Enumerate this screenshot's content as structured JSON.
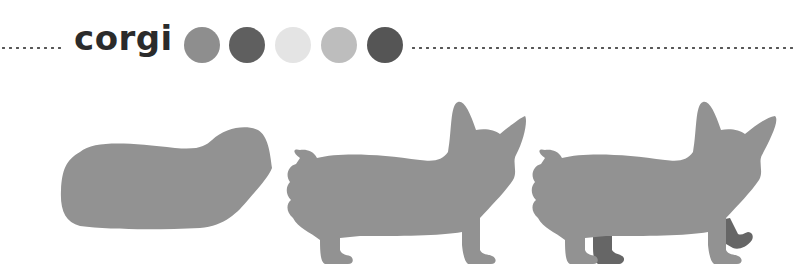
{
  "title": "corgi",
  "palette": [
    {
      "name": "mid-grey",
      "color": "#8e8e8e"
    },
    {
      "name": "dark-grey",
      "color": "#5f5f5f"
    },
    {
      "name": "very-light-grey",
      "color": "#e4e4e4"
    },
    {
      "name": "light-grey",
      "color": "#bdbdbd"
    },
    {
      "name": "charcoal",
      "color": "#555555"
    }
  ],
  "shapes": {
    "body_color": "#929292",
    "leg_color": "#666666",
    "steps": [
      "body-blob",
      "corgi-silhouette",
      "corgi-with-back-legs"
    ]
  }
}
